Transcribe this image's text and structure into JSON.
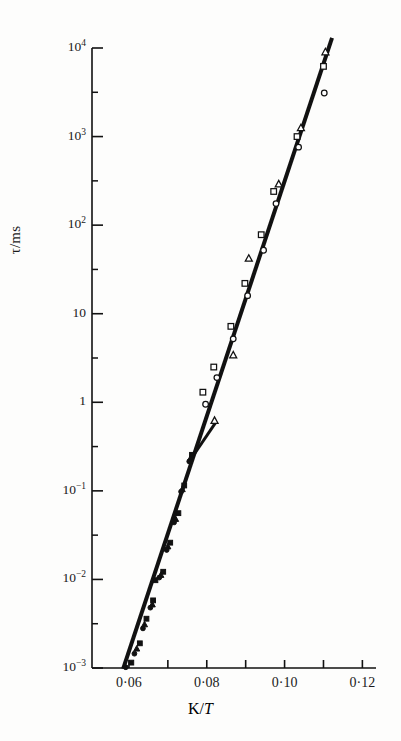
{
  "figure": {
    "background_color": "#fdfdfc",
    "ink_color": "#111111"
  },
  "axes": {
    "ylabel": "τ/ms",
    "xlabel_prefix": "K/",
    "xlabel_italic": "T",
    "xlabel_full": "K/T",
    "y_tick_labels": [
      "10⁴",
      "10³",
      "10²",
      "10",
      "1",
      "10⁻¹",
      "10⁻²",
      "10⁻³"
    ],
    "x_tick_labels": [
      "0·06",
      "0·08",
      "0·10",
      "0·12"
    ],
    "x_minor_ticks": [
      "0·07",
      "0·09",
      "0·11"
    ]
  },
  "chart_data": {
    "type": "scatter",
    "title": "",
    "xlabel": "K/T",
    "ylabel": "τ/ms",
    "xlim": [
      0.0505,
      0.1235
    ],
    "ylim_log10": [
      -3,
      4
    ],
    "yscale": "log",
    "xscale": "linear",
    "grid": false,
    "legend": "none",
    "x_ticks": [
      0.06,
      0.07,
      0.08,
      0.09,
      0.1,
      0.11,
      0.12
    ],
    "x_major_ticks": [
      0.06,
      0.08,
      0.1,
      0.12
    ],
    "y_ticks": [
      0.001,
      0.01,
      0.1,
      1,
      10,
      100,
      1000,
      10000
    ],
    "series": [
      {
        "name": "open-triangle",
        "marker": "triangle",
        "fill": "open",
        "points": [
          {
            "x": 0.1105,
            "y": 9000
          },
          {
            "x": 0.1042,
            "y": 1250
          },
          {
            "x": 0.0985,
            "y": 290
          },
          {
            "x": 0.0908,
            "y": 42
          },
          {
            "x": 0.0868,
            "y": 3.4
          },
          {
            "x": 0.082,
            "y": 0.62
          }
        ]
      },
      {
        "name": "open-square",
        "marker": "square",
        "fill": "open",
        "points": [
          {
            "x": 0.11,
            "y": 6200
          },
          {
            "x": 0.1032,
            "y": 1000
          },
          {
            "x": 0.0972,
            "y": 240
          },
          {
            "x": 0.094,
            "y": 78
          },
          {
            "x": 0.0898,
            "y": 22
          },
          {
            "x": 0.0862,
            "y": 7.2
          },
          {
            "x": 0.0818,
            "y": 2.5
          },
          {
            "x": 0.079,
            "y": 1.3
          }
        ]
      },
      {
        "name": "open-circle",
        "marker": "circle",
        "fill": "open",
        "points": [
          {
            "x": 0.1102,
            "y": 3100
          },
          {
            "x": 0.1036,
            "y": 760
          },
          {
            "x": 0.0978,
            "y": 175
          },
          {
            "x": 0.0946,
            "y": 52
          },
          {
            "x": 0.0905,
            "y": 16
          },
          {
            "x": 0.0868,
            "y": 5.2
          },
          {
            "x": 0.0826,
            "y": 1.9
          },
          {
            "x": 0.0797,
            "y": 0.95
          }
        ]
      },
      {
        "name": "filled-square",
        "marker": "square",
        "fill": "filled",
        "points": [
          {
            "x": 0.0762,
            "y": 0.255
          },
          {
            "x": 0.0742,
            "y": 0.115
          },
          {
            "x": 0.0727,
            "y": 0.056
          },
          {
            "x": 0.0706,
            "y": 0.026
          },
          {
            "x": 0.0688,
            "y": 0.0122
          },
          {
            "x": 0.0668,
            "y": 0.0098
          },
          {
            "x": 0.0662,
            "y": 0.0058
          },
          {
            "x": 0.0645,
            "y": 0.0036
          },
          {
            "x": 0.0628,
            "y": 0.0019
          },
          {
            "x": 0.0606,
            "y": 0.00115
          }
        ]
      },
      {
        "name": "filled-triangle",
        "marker": "triangle",
        "fill": "filled",
        "points": [
          {
            "x": 0.0758,
            "y": 0.232
          },
          {
            "x": 0.0737,
            "y": 0.104
          },
          {
            "x": 0.072,
            "y": 0.048
          },
          {
            "x": 0.07,
            "y": 0.0235
          },
          {
            "x": 0.0682,
            "y": 0.0112
          },
          {
            "x": 0.066,
            "y": 0.0052
          },
          {
            "x": 0.064,
            "y": 0.0031
          },
          {
            "x": 0.062,
            "y": 0.00165
          }
        ]
      },
      {
        "name": "filled-circle",
        "marker": "circle",
        "fill": "filled",
        "points": [
          {
            "x": 0.0755,
            "y": 0.215
          },
          {
            "x": 0.0734,
            "y": 0.098
          },
          {
            "x": 0.0716,
            "y": 0.044
          },
          {
            "x": 0.0697,
            "y": 0.0215
          },
          {
            "x": 0.0678,
            "y": 0.0105
          },
          {
            "x": 0.0655,
            "y": 0.0048
          },
          {
            "x": 0.0636,
            "y": 0.0028
          },
          {
            "x": 0.0614,
            "y": 0.00145
          },
          {
            "x": 0.0592,
            "y": 0.00102
          }
        ]
      }
    ],
    "fit_lines": [
      {
        "name": "main-fit-line",
        "x_start": 0.0585,
        "y_start": 0.00098,
        "x_end": 0.1122,
        "y_end": 13000,
        "width": 4
      },
      {
        "name": "branch-fit-line",
        "x_start": 0.0752,
        "y_start": 0.205,
        "x_end": 0.0824,
        "y_end": 0.6,
        "width": 3
      }
    ]
  }
}
